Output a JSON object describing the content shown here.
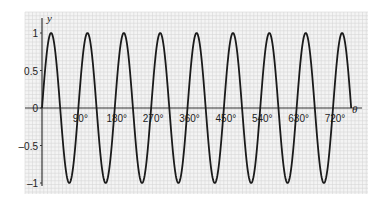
{
  "chart_data": {
    "type": "line",
    "title": "",
    "xlabel": "θ",
    "ylabel": "y",
    "function": "y = sin(4θ)",
    "xlim": [
      0,
      765
    ],
    "ylim": [
      -1,
      1
    ],
    "grid": true,
    "x_ticks": [
      {
        "value": 90,
        "label": "90°"
      },
      {
        "value": 180,
        "label": "180°"
      },
      {
        "value": 270,
        "label": "270°"
      },
      {
        "value": 360,
        "label": "360°"
      },
      {
        "value": 450,
        "label": "450°"
      },
      {
        "value": 540,
        "label": "540°"
      },
      {
        "value": 630,
        "label": "630°"
      },
      {
        "value": 720,
        "label": "720°"
      }
    ],
    "y_ticks": [
      {
        "value": 1,
        "label": "1"
      },
      {
        "value": 0.5,
        "label": "0.5"
      },
      {
        "value": 0,
        "label": "0"
      },
      {
        "value": -0.5,
        "label": "–0.5"
      },
      {
        "value": -1,
        "label": "–1"
      }
    ],
    "series": [
      {
        "name": "y = sin 4θ",
        "x": [
          0,
          22.5,
          45,
          67.5,
          90,
          112.5,
          135,
          157.5,
          180,
          202.5,
          225,
          247.5,
          270,
          292.5,
          315,
          337.5,
          360,
          382.5,
          405,
          427.5,
          450,
          472.5,
          495,
          517.5,
          540,
          562.5,
          585,
          607.5,
          630,
          652.5,
          675,
          697.5,
          720,
          742.5
        ],
        "values": [
          0,
          1,
          0,
          -1,
          0,
          1,
          0,
          -1,
          0,
          1,
          0,
          -1,
          0,
          1,
          0,
          -1,
          0,
          1,
          0,
          -1,
          0,
          1,
          0,
          -1,
          0,
          1,
          0,
          -1,
          0,
          1,
          0,
          -1,
          0,
          1
        ]
      }
    ],
    "colors": {
      "curve": "#1a1a1a",
      "axis": "#333333",
      "grid_minor": "#d6d6d6",
      "grid_major": "#b8b8b8",
      "background": "#f4f4f4"
    }
  }
}
